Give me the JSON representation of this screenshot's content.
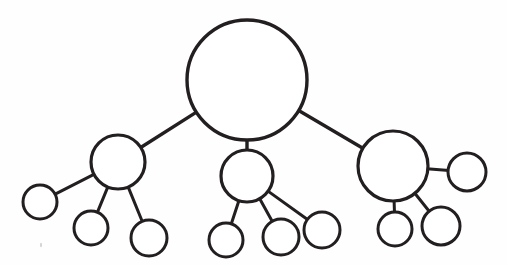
{
  "diagram": {
    "background_color": "#fefefe",
    "stroke_color": "#231f20",
    "fill_color": "#ffffff",
    "canvas": {
      "width": 507,
      "height": 265
    },
    "nodes": [
      {
        "id": "root",
        "label": "root node",
        "cx": 247,
        "cy": 80,
        "r": 60,
        "stroke_width": 3.4
      },
      {
        "id": "branch-left",
        "label": "left branch node",
        "cx": 118,
        "cy": 162,
        "r": 27,
        "stroke_width": 3.2
      },
      {
        "id": "branch-middle",
        "label": "middle branch node",
        "cx": 247,
        "cy": 176,
        "r": 26,
        "stroke_width": 3.2
      },
      {
        "id": "branch-right",
        "label": "right branch node",
        "cx": 393,
        "cy": 166,
        "r": 35,
        "stroke_width": 3.2
      },
      {
        "id": "leaf-l1",
        "label": "left branch leaf 1",
        "cx": 40,
        "cy": 202,
        "r": 17,
        "stroke_width": 3.0
      },
      {
        "id": "leaf-l2",
        "label": "left branch leaf 2",
        "cx": 91,
        "cy": 228,
        "r": 17,
        "stroke_width": 3.0
      },
      {
        "id": "leaf-l3",
        "label": "left branch leaf 3",
        "cx": 149,
        "cy": 238,
        "r": 18,
        "stroke_width": 3.0
      },
      {
        "id": "leaf-m1",
        "label": "middle branch leaf 1",
        "cx": 226,
        "cy": 240,
        "r": 17,
        "stroke_width": 3.0
      },
      {
        "id": "leaf-m2",
        "label": "middle branch leaf 2",
        "cx": 281,
        "cy": 237,
        "r": 18,
        "stroke_width": 3.0
      },
      {
        "id": "leaf-m3",
        "label": "middle branch leaf 3",
        "cx": 322,
        "cy": 230,
        "r": 18,
        "stroke_width": 3.0
      },
      {
        "id": "leaf-r1",
        "label": "right branch leaf 1",
        "cx": 395,
        "cy": 229,
        "r": 17,
        "stroke_width": 3.0
      },
      {
        "id": "leaf-r2",
        "label": "right branch leaf 2",
        "cx": 441,
        "cy": 226,
        "r": 19,
        "stroke_width": 3.0
      },
      {
        "id": "leaf-r3",
        "label": "right branch side leaf",
        "cx": 467,
        "cy": 172,
        "r": 19,
        "stroke_width": 3.0
      }
    ],
    "edges": [
      {
        "id": "edge-root-left",
        "label": "root to left branch",
        "from": "root",
        "to": "branch-left",
        "stroke_width": 3.4
      },
      {
        "id": "edge-root-middle",
        "label": "root to middle branch",
        "from": "root",
        "to": "branch-middle",
        "stroke_width": 3.4
      },
      {
        "id": "edge-root-right",
        "label": "root to right branch",
        "from": "root",
        "to": "branch-right",
        "stroke_width": 3.4
      },
      {
        "id": "edge-left-leaf1",
        "label": "left branch to leaf 1",
        "from": "branch-left",
        "to": "leaf-l1",
        "stroke_width": 3.0
      },
      {
        "id": "edge-left-leaf2",
        "label": "left branch to leaf 2",
        "from": "branch-left",
        "to": "leaf-l2",
        "stroke_width": 3.0
      },
      {
        "id": "edge-left-leaf3",
        "label": "left branch to leaf 3",
        "from": "branch-left",
        "to": "leaf-l3",
        "stroke_width": 3.0
      },
      {
        "id": "edge-middle-leaf1",
        "label": "middle branch to leaf 1",
        "from": "branch-middle",
        "to": "leaf-m1",
        "stroke_width": 3.0
      },
      {
        "id": "edge-middle-leaf2",
        "label": "middle branch to leaf 2",
        "from": "branch-middle",
        "to": "leaf-m2",
        "stroke_width": 3.0
      },
      {
        "id": "edge-middle-leaf3",
        "label": "middle branch to leaf 3",
        "from": "branch-middle",
        "to": "leaf-m3",
        "stroke_width": 3.0
      },
      {
        "id": "edge-right-leaf1",
        "label": "right branch to leaf 1",
        "from": "branch-right",
        "to": "leaf-r1",
        "stroke_width": 3.0
      },
      {
        "id": "edge-right-leaf2",
        "label": "right branch to leaf 2",
        "from": "branch-right",
        "to": "leaf-r2",
        "stroke_width": 3.0
      },
      {
        "id": "edge-right-leaf3",
        "label": "right branch to side leaf",
        "from": "branch-right",
        "to": "leaf-r3",
        "stroke_width": 3.0
      }
    ],
    "specks": [
      {
        "id": "speck-1",
        "cx": 41,
        "cy": 245,
        "rx": 0.8,
        "ry": 2.2
      }
    ]
  }
}
